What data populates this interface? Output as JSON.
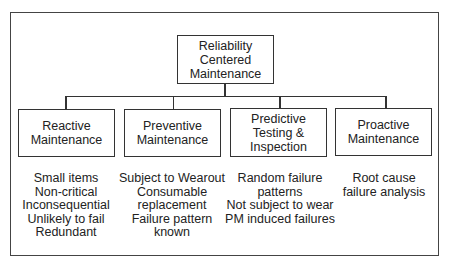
{
  "diagram": {
    "type": "hierarchy",
    "root": {
      "lines": [
        "Reliability",
        "Centered",
        "Maintenance"
      ]
    },
    "children": [
      {
        "lines": [
          "Reactive",
          "Maintenance"
        ],
        "details": [
          "Small items",
          "Non-critical",
          "Inconsequential",
          "Unlikely to fail",
          "Redundant"
        ]
      },
      {
        "lines": [
          "Preventive",
          "Maintenance"
        ],
        "details": [
          "Subject to Wearout",
          "Consumable",
          "replacement",
          "Failure pattern",
          "known"
        ]
      },
      {
        "lines": [
          "Predictive",
          "Testing &",
          "Inspection"
        ],
        "details": [
          "Random failure",
          "patterns",
          "Not subject to wear",
          "PM induced failures"
        ]
      },
      {
        "lines": [
          "Proactive",
          "Maintenance"
        ],
        "details": [
          "Root cause",
          "failure analysis"
        ]
      }
    ],
    "colors": {
      "line": "#333333",
      "background": "#ffffff",
      "text": "#222222"
    }
  }
}
